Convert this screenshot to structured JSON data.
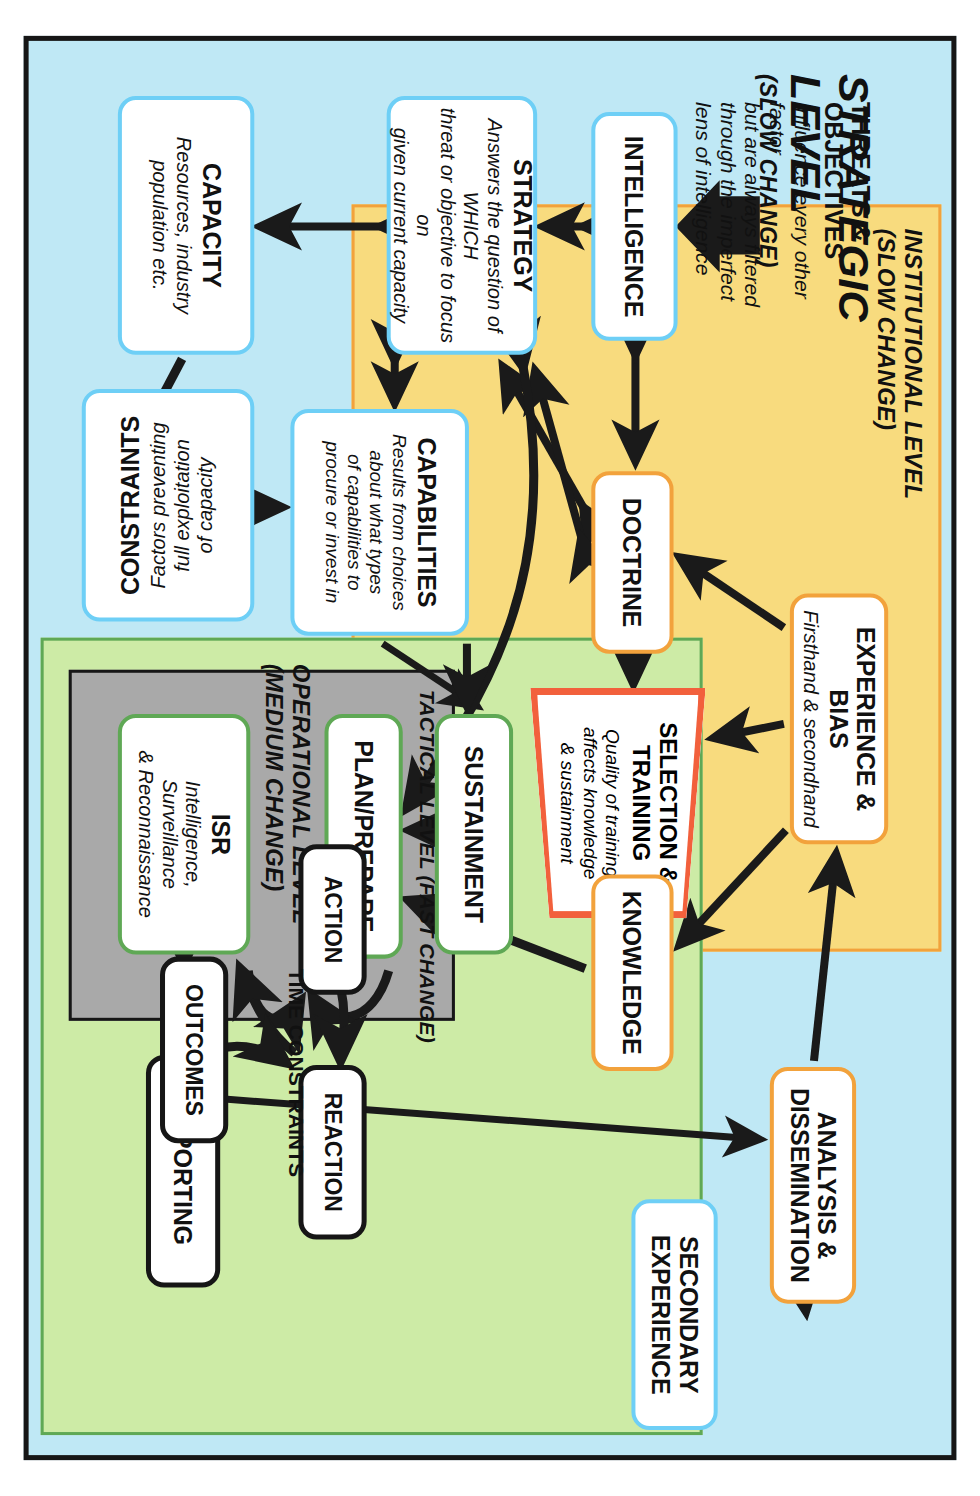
{
  "panels": {
    "strategic": {
      "title": "STRATEGIC\nLEVEL",
      "subtitle": "(SLOW CHANGE)",
      "color": "#bfe8f5"
    },
    "institutional": {
      "title": "INSTITUTIONAL LEVEL\n(SLOW CHANGE)",
      "color": "#f8db7e",
      "border": "#f2a23c"
    },
    "operational": {
      "title": "OPERATIONAL LEVEL\n(MEDIUM CHANGE)",
      "color": "#cdeba6",
      "border": "#5fa855"
    },
    "tactical": {
      "title": "TACTICAL LEVEL (FAST CHANGE)",
      "color": "#a9a9a9",
      "border": "#161616"
    }
  },
  "nodes": {
    "threats": {
      "title": "THREATS & OBJECTIVES",
      "subtitle": "Influence every other factor\nbut are always filtered\nthrough the imperfect\nlens of intelligence"
    },
    "intelligence": {
      "title": "INTELLIGENCE",
      "subtitle": ""
    },
    "strategy": {
      "title": "STRATEGY",
      "subtitle": "Answers the question of WHICH\nthreat or objective to focus on\ngiven current capacity"
    },
    "capacity": {
      "title": "CAPACITY",
      "subtitle": "Resources, industry\npopulation etc."
    },
    "capabilities": {
      "title": "CAPABILITIES",
      "subtitle": "Results from choices\nabout what types\nof capabilities to\nprocure or invest in"
    },
    "constraints": {
      "title": "CONSTRAINTS",
      "subtitle": "Factors preventing\nfull exploitation\nof capacity"
    },
    "experience": {
      "title": "EXPERIENCE & BIAS",
      "subtitle": "Firsthand & secondhand"
    },
    "doctrine": {
      "title": "DOCTRINE",
      "subtitle": ""
    },
    "training": {
      "title": "SELECTION &\nTRAINING",
      "subtitle": "Quality of training\naffects knowledge\n& sustainment"
    },
    "knowledge": {
      "title": "KNOWLEDGE",
      "subtitle": ""
    },
    "analysis": {
      "title": "ANALYSIS &\nDISSEMINATION",
      "subtitle": ""
    },
    "secondary": {
      "title": "SECONDARY\nEXPERIENCE",
      "subtitle": ""
    },
    "sustainment": {
      "title": "SUSTAINMENT",
      "subtitle": ""
    },
    "plan_prepare": {
      "title": "PLAN/PREPARE",
      "subtitle": ""
    },
    "isr": {
      "title": "ISR",
      "subtitle": "Intelligence, Surveillance\n& Reconnaissance"
    },
    "reporting": {
      "title": "REPORTING",
      "subtitle": ""
    },
    "action": {
      "title": "ACTION",
      "subtitle": ""
    },
    "reaction": {
      "title": "REACTION",
      "subtitle": ""
    },
    "outcomes": {
      "title": "OUTCOMES",
      "subtitle": ""
    }
  },
  "labels": {
    "time_constraints": "TIME CONSTRAINTS"
  },
  "colors": {
    "strategic_fill": "#bfe8f5",
    "strategic_node_border": "#6ecff6",
    "institutional_fill": "#f8db7e",
    "institutional_node_border": "#f2a23c",
    "operational_fill": "#cdeba6",
    "operational_node_border": "#5fa855",
    "tactical_fill": "#a9a9a9",
    "training_border": "#f2603c",
    "arrow": "#1a1a1a",
    "outer_border": "#161616"
  }
}
